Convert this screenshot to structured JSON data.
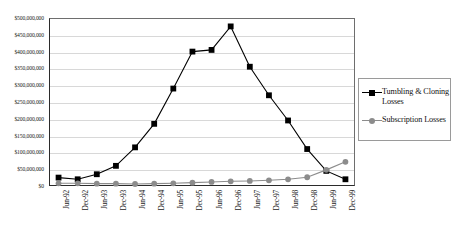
{
  "chart_data": {
    "type": "line",
    "title": "",
    "xlabel": "",
    "ylabel": "",
    "grid": true,
    "legend_position": "right",
    "ylim": [
      0,
      500000000
    ],
    "ytick_step": 50000000,
    "categories": [
      "Jun-92",
      "Dec-92",
      "Jun-93",
      "Dec-93",
      "Jun-94",
      "Dec-94",
      "Jun-95",
      "Dec-95",
      "Jun-96",
      "Dec-96",
      "Jun-97",
      "Dec-97",
      "Jun-98",
      "Dec-98",
      "Jun-99",
      "Dec-99"
    ],
    "ytick_labels": [
      "$500,000,000",
      "$450,000,000",
      "$400,000,000",
      "$350,000,000",
      "$300,000,000",
      "$250,000,000",
      "$200,000,000",
      "$150,000,000",
      "$100,000,000",
      "$50,000,000",
      "$0"
    ],
    "ytick_values": [
      500000000,
      450000000,
      400000000,
      350000000,
      300000000,
      250000000,
      200000000,
      150000000,
      100000000,
      50000000,
      0
    ],
    "series": [
      {
        "name": "Tumbling & Cloning Losses",
        "color": "#000000",
        "marker": "square",
        "values": [
          25000000,
          20000000,
          35000000,
          60000000,
          115000000,
          185000000,
          290000000,
          400000000,
          405000000,
          475000000,
          355000000,
          270000000,
          195000000,
          110000000,
          45000000,
          20000000
        ]
      },
      {
        "name": "Subscription Losses",
        "color": "#8c8c8c",
        "marker": "circle",
        "values": [
          8000000,
          8000000,
          7000000,
          7000000,
          6000000,
          7000000,
          8000000,
          10000000,
          12000000,
          14000000,
          15000000,
          17000000,
          20000000,
          26000000,
          48000000,
          72000000
        ]
      }
    ]
  },
  "legend": {
    "entries": [
      {
        "label": "Tumbling & Cloning Losses"
      },
      {
        "label": "Subscription Losses"
      }
    ]
  }
}
